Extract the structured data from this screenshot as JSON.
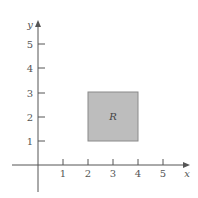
{
  "diagram": {
    "type": "coordinate-plane-region",
    "axes": {
      "x_label": "x",
      "y_label": "y",
      "x_ticks": [
        "1",
        "2",
        "3",
        "4",
        "5"
      ],
      "y_ticks": [
        "1",
        "2",
        "3",
        "4",
        "5"
      ]
    },
    "region": {
      "label": "R",
      "x_range": [
        2,
        4
      ],
      "y_range": [
        1,
        3
      ],
      "fill": "#bdbdbd",
      "stroke": "#8a8a8a"
    },
    "colors": {
      "axis": "#555555",
      "background": "#ffffff"
    }
  }
}
